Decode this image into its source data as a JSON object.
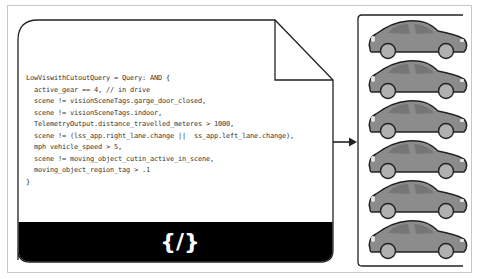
{
  "document": {
    "code_lines": [
      "LowViswithCutoutQuery = Query: AND {",
      "  active_gear == 4, // in drive",
      "  scene != visionSceneTags.garge_door_closed,",
      "  scene != visionSceneTags.indoor,",
      "  TelemetryOutput.distance_travelled_meteres > 1000,",
      "  scene != (lss_app.right_lane.change ||  ss_app.left_lane.change),",
      "  mph vehicle_speed > 5,",
      "  scene != moving_object_cutin_active_in_scene,",
      "  moving_object_region_tag > .1",
      "}"
    ],
    "footer_icon": "{/}",
    "footer_icon_name": "code-icon"
  },
  "arrow": {
    "icon": "arrow-right-icon"
  },
  "results": {
    "icon": "car-icon",
    "count": 6,
    "car_body_color": "#8c8c8c",
    "car_window_color": "#777777",
    "wheel_color": "#b3b3b3"
  },
  "colors": {
    "stroke": "#222222",
    "footer_band": "#000000",
    "frame_border": "#c8c8c8"
  }
}
